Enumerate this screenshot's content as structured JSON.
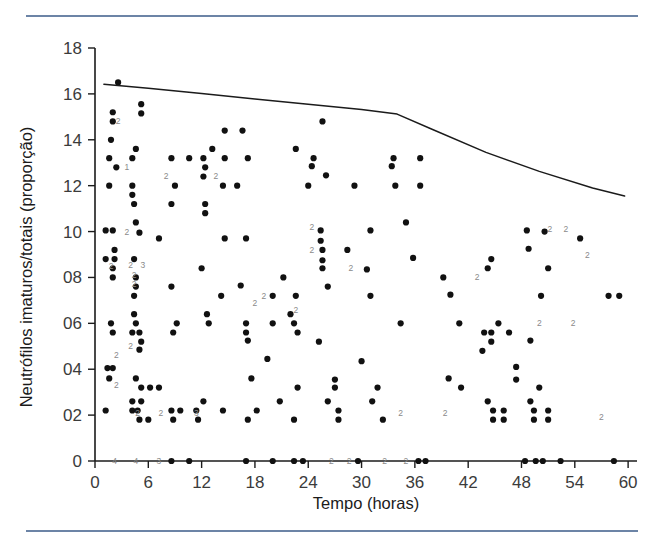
{
  "page": {
    "background_color": "#ffffff",
    "rule_color": "#6c84a6"
  },
  "chart_data": {
    "type": "scatter",
    "title": "",
    "xlabel": "Tempo (horas)",
    "ylabel": "Neutrófilos imaturos/totais (proporção)",
    "xlim": [
      0,
      61
    ],
    "ylim": [
      0,
      18
    ],
    "xticks": [
      0,
      6,
      12,
      18,
      24,
      30,
      36,
      42,
      48,
      54,
      60
    ],
    "xticklabels": [
      "0",
      "6",
      "12",
      "18",
      "24",
      "30",
      "36",
      "42",
      "48",
      "54",
      "60"
    ],
    "yticks": [
      0,
      2,
      4,
      6,
      8,
      10,
      12,
      14,
      16,
      18
    ],
    "yticklabels": [
      "0",
      "02",
      "04",
      "06",
      "08",
      "10",
      "12",
      "14",
      "16",
      "18"
    ],
    "grid": false,
    "legend": null,
    "marker_color": "#111111",
    "marker_size": 3.1,
    "series": [
      {
        "name": "Neutrófilos imaturos/totais",
        "points": [
          [
            2.6,
            16.5
          ],
          [
            2.0,
            15.2
          ],
          [
            2.0,
            14.8
          ],
          [
            5.2,
            15.55
          ],
          [
            5.2,
            15.15
          ],
          [
            14.6,
            14.4
          ],
          [
            16.6,
            14.4
          ],
          [
            25.6,
            14.8
          ],
          [
            1.8,
            14.0
          ],
          [
            4.6,
            13.6
          ],
          [
            13.2,
            13.6
          ],
          [
            22.6,
            13.6
          ],
          [
            1.6,
            13.2
          ],
          [
            4.2,
            13.2
          ],
          [
            8.6,
            13.2
          ],
          [
            10.6,
            13.2
          ],
          [
            12.2,
            13.2
          ],
          [
            14.6,
            13.2
          ],
          [
            17.2,
            13.2
          ],
          [
            24.6,
            13.2
          ],
          [
            33.6,
            13.2
          ],
          [
            36.6,
            13.2
          ],
          [
            2.4,
            12.8
          ],
          [
            12.4,
            12.8
          ],
          [
            24.4,
            12.85
          ],
          [
            33.4,
            12.85
          ],
          [
            12.2,
            12.4
          ],
          [
            26.0,
            12.45
          ],
          [
            1.6,
            12.0
          ],
          [
            4.2,
            12.0
          ],
          [
            9.0,
            12.0
          ],
          [
            14.4,
            12.0
          ],
          [
            16.0,
            12.0
          ],
          [
            24.0,
            12.0
          ],
          [
            29.2,
            12.0
          ],
          [
            33.8,
            12.0
          ],
          [
            36.6,
            12.0
          ],
          [
            4.2,
            11.6
          ],
          [
            4.4,
            11.2
          ],
          [
            8.6,
            11.2
          ],
          [
            12.4,
            11.2
          ],
          [
            12.4,
            10.8
          ],
          [
            4.6,
            10.4
          ],
          [
            35.0,
            10.4
          ],
          [
            1.2,
            10.05
          ],
          [
            2.0,
            10.05
          ],
          [
            25.4,
            10.05
          ],
          [
            31.0,
            10.05
          ],
          [
            48.6,
            10.05
          ],
          [
            5.0,
            9.95
          ],
          [
            7.2,
            9.7
          ],
          [
            14.6,
            9.7
          ],
          [
            17.0,
            9.7
          ],
          [
            25.4,
            9.6
          ],
          [
            50.6,
            10.0
          ],
          [
            54.6,
            9.7
          ],
          [
            2.2,
            9.2
          ],
          [
            28.4,
            9.2
          ],
          [
            48.8,
            9.25
          ],
          [
            25.6,
            9.2
          ],
          [
            1.2,
            8.8
          ],
          [
            2.2,
            8.8
          ],
          [
            4.4,
            8.8
          ],
          [
            25.6,
            8.75
          ],
          [
            35.8,
            8.85
          ],
          [
            44.6,
            8.8
          ],
          [
            2.0,
            8.4
          ],
          [
            12.0,
            8.4
          ],
          [
            25.6,
            8.4
          ],
          [
            30.6,
            8.35
          ],
          [
            44.2,
            8.4
          ],
          [
            51.0,
            8.4
          ],
          [
            2.0,
            8.0
          ],
          [
            4.6,
            8.0
          ],
          [
            21.2,
            8.0
          ],
          [
            39.2,
            8.0
          ],
          [
            4.6,
            7.6
          ],
          [
            8.6,
            7.6
          ],
          [
            16.4,
            7.65
          ],
          [
            26.2,
            7.6
          ],
          [
            4.4,
            7.2
          ],
          [
            14.2,
            7.2
          ],
          [
            20.0,
            7.2
          ],
          [
            22.6,
            7.2
          ],
          [
            31.0,
            7.2
          ],
          [
            40.0,
            7.25
          ],
          [
            50.2,
            7.2
          ],
          [
            57.8,
            7.2
          ],
          [
            59.0,
            7.2
          ],
          [
            4.4,
            6.4
          ],
          [
            12.6,
            6.4
          ],
          [
            22.0,
            6.4
          ],
          [
            1.8,
            6.0
          ],
          [
            4.6,
            6.0
          ],
          [
            9.2,
            6.0
          ],
          [
            12.8,
            6.0
          ],
          [
            17.0,
            6.0
          ],
          [
            20.0,
            6.0
          ],
          [
            22.4,
            6.0
          ],
          [
            34.4,
            6.0
          ],
          [
            41.0,
            6.0
          ],
          [
            45.4,
            6.0
          ],
          [
            2.0,
            5.6
          ],
          [
            4.2,
            5.6
          ],
          [
            5.0,
            5.6
          ],
          [
            8.8,
            5.6
          ],
          [
            17.0,
            5.6
          ],
          [
            22.8,
            5.6
          ],
          [
            43.8,
            5.6
          ],
          [
            44.6,
            5.6
          ],
          [
            46.6,
            5.6
          ],
          [
            5.2,
            5.2
          ],
          [
            17.2,
            5.25
          ],
          [
            25.2,
            5.2
          ],
          [
            44.6,
            5.2
          ],
          [
            49.0,
            5.25
          ],
          [
            5.0,
            4.85
          ],
          [
            43.6,
            4.8
          ],
          [
            1.4,
            4.05
          ],
          [
            2.0,
            4.05
          ],
          [
            19.4,
            4.45
          ],
          [
            30.0,
            4.35
          ],
          [
            1.6,
            3.6
          ],
          [
            4.6,
            3.6
          ],
          [
            17.6,
            3.6
          ],
          [
            27.0,
            3.55
          ],
          [
            39.8,
            3.6
          ],
          [
            47.4,
            4.1
          ],
          [
            47.4,
            3.55
          ],
          [
            5.2,
            3.2
          ],
          [
            6.2,
            3.2
          ],
          [
            7.2,
            3.2
          ],
          [
            22.8,
            3.2
          ],
          [
            27.0,
            3.2
          ],
          [
            31.8,
            3.2
          ],
          [
            41.2,
            3.2
          ],
          [
            50.0,
            3.2
          ],
          [
            4.2,
            2.6
          ],
          [
            5.2,
            2.6
          ],
          [
            12.2,
            2.6
          ],
          [
            20.8,
            2.6
          ],
          [
            26.2,
            2.6
          ],
          [
            31.2,
            2.6
          ],
          [
            44.2,
            2.6
          ],
          [
            49.0,
            2.6
          ],
          [
            1.2,
            2.2
          ],
          [
            4.2,
            2.2
          ],
          [
            4.8,
            2.2
          ],
          [
            8.6,
            2.2
          ],
          [
            9.6,
            2.2
          ],
          [
            11.4,
            2.2
          ],
          [
            14.4,
            2.2
          ],
          [
            18.2,
            2.2
          ],
          [
            27.4,
            2.2
          ],
          [
            44.8,
            2.2
          ],
          [
            46.0,
            2.2
          ],
          [
            49.4,
            2.2
          ],
          [
            51.0,
            2.2
          ],
          [
            5.0,
            1.8
          ],
          [
            6.0,
            1.8
          ],
          [
            8.8,
            1.8
          ],
          [
            11.6,
            1.8
          ],
          [
            17.2,
            1.8
          ],
          [
            22.4,
            1.8
          ],
          [
            27.4,
            1.8
          ],
          [
            32.4,
            1.8
          ],
          [
            44.8,
            1.8
          ],
          [
            46.0,
            1.8
          ],
          [
            49.4,
            1.8
          ],
          [
            51.0,
            1.8
          ],
          [
            8.6,
            0.0
          ],
          [
            10.6,
            0.0
          ],
          [
            17.0,
            0.0
          ],
          [
            20.0,
            0.0
          ],
          [
            22.4,
            0.0
          ],
          [
            23.4,
            0.0
          ],
          [
            29.6,
            0.0
          ],
          [
            36.4,
            0.0
          ],
          [
            37.2,
            0.0
          ],
          [
            48.4,
            0.0
          ],
          [
            49.6,
            0.0
          ],
          [
            50.4,
            0.0
          ],
          [
            52.4,
            0.0
          ],
          [
            58.4,
            0.0
          ]
        ]
      }
    ],
    "count_labels": [
      {
        "x": 2.6,
        "y": 14.8,
        "text": "2"
      },
      {
        "x": 3.6,
        "y": 12.8,
        "text": "1"
      },
      {
        "x": 8.0,
        "y": 12.4,
        "text": "2"
      },
      {
        "x": 13.6,
        "y": 12.4,
        "text": "2"
      },
      {
        "x": 3.6,
        "y": 10.0,
        "text": "2"
      },
      {
        "x": 24.4,
        "y": 10.2,
        "text": "2"
      },
      {
        "x": 24.4,
        "y": 9.2,
        "text": "2"
      },
      {
        "x": 1.8,
        "y": 8.5,
        "text": "2"
      },
      {
        "x": 4.0,
        "y": 8.55,
        "text": "2"
      },
      {
        "x": 5.4,
        "y": 8.55,
        "text": "3"
      },
      {
        "x": 4.4,
        "y": 8.1,
        "text": "2"
      },
      {
        "x": 4.4,
        "y": 7.7,
        "text": "2"
      },
      {
        "x": 19.0,
        "y": 7.2,
        "text": "2"
      },
      {
        "x": 28.8,
        "y": 8.4,
        "text": "2"
      },
      {
        "x": 43.0,
        "y": 8.0,
        "text": "2"
      },
      {
        "x": 18.0,
        "y": 6.9,
        "text": "2"
      },
      {
        "x": 22.6,
        "y": 6.6,
        "text": "2"
      },
      {
        "x": 4.0,
        "y": 5.0,
        "text": "2"
      },
      {
        "x": 50.0,
        "y": 6.0,
        "text": "2"
      },
      {
        "x": 53.8,
        "y": 6.0,
        "text": "2"
      },
      {
        "x": 55.4,
        "y": 9.0,
        "text": "2"
      },
      {
        "x": 51.2,
        "y": 10.1,
        "text": "2"
      },
      {
        "x": 53.0,
        "y": 10.1,
        "text": "2"
      },
      {
        "x": 2.4,
        "y": 4.6,
        "text": "2"
      },
      {
        "x": 2.4,
        "y": 3.3,
        "text": "2"
      },
      {
        "x": 4.8,
        "y": 2.1,
        "text": "2"
      },
      {
        "x": 7.4,
        "y": 2.1,
        "text": "2"
      },
      {
        "x": 11.4,
        "y": 2.1,
        "text": "3"
      },
      {
        "x": 34.4,
        "y": 2.1,
        "text": "2"
      },
      {
        "x": 39.4,
        "y": 2.1,
        "text": "2"
      },
      {
        "x": 57.0,
        "y": 1.9,
        "text": "2"
      },
      {
        "x": 2.2,
        "y": 0.0,
        "text": "4"
      },
      {
        "x": 4.6,
        "y": 0.0,
        "text": "4"
      },
      {
        "x": 7.2,
        "y": 0.0,
        "text": "3"
      },
      {
        "x": 26.6,
        "y": 0.0,
        "text": "2"
      },
      {
        "x": 28.6,
        "y": 0.0,
        "text": "2"
      },
      {
        "x": 32.6,
        "y": 0.0,
        "text": "2"
      },
      {
        "x": 35.0,
        "y": 0.0,
        "text": "2"
      }
    ],
    "trend_line": {
      "name": "linha de tendência",
      "color": "#1b1b1b",
      "points": [
        [
          1.0,
          16.42
        ],
        [
          6.0,
          16.25
        ],
        [
          12.0,
          16.02
        ],
        [
          18.0,
          15.78
        ],
        [
          24.0,
          15.55
        ],
        [
          30.0,
          15.32
        ],
        [
          34.0,
          15.12
        ],
        [
          38.0,
          14.45
        ],
        [
          44.0,
          13.45
        ],
        [
          50.0,
          12.62
        ],
        [
          56.0,
          11.9
        ],
        [
          59.6,
          11.55
        ]
      ]
    }
  }
}
